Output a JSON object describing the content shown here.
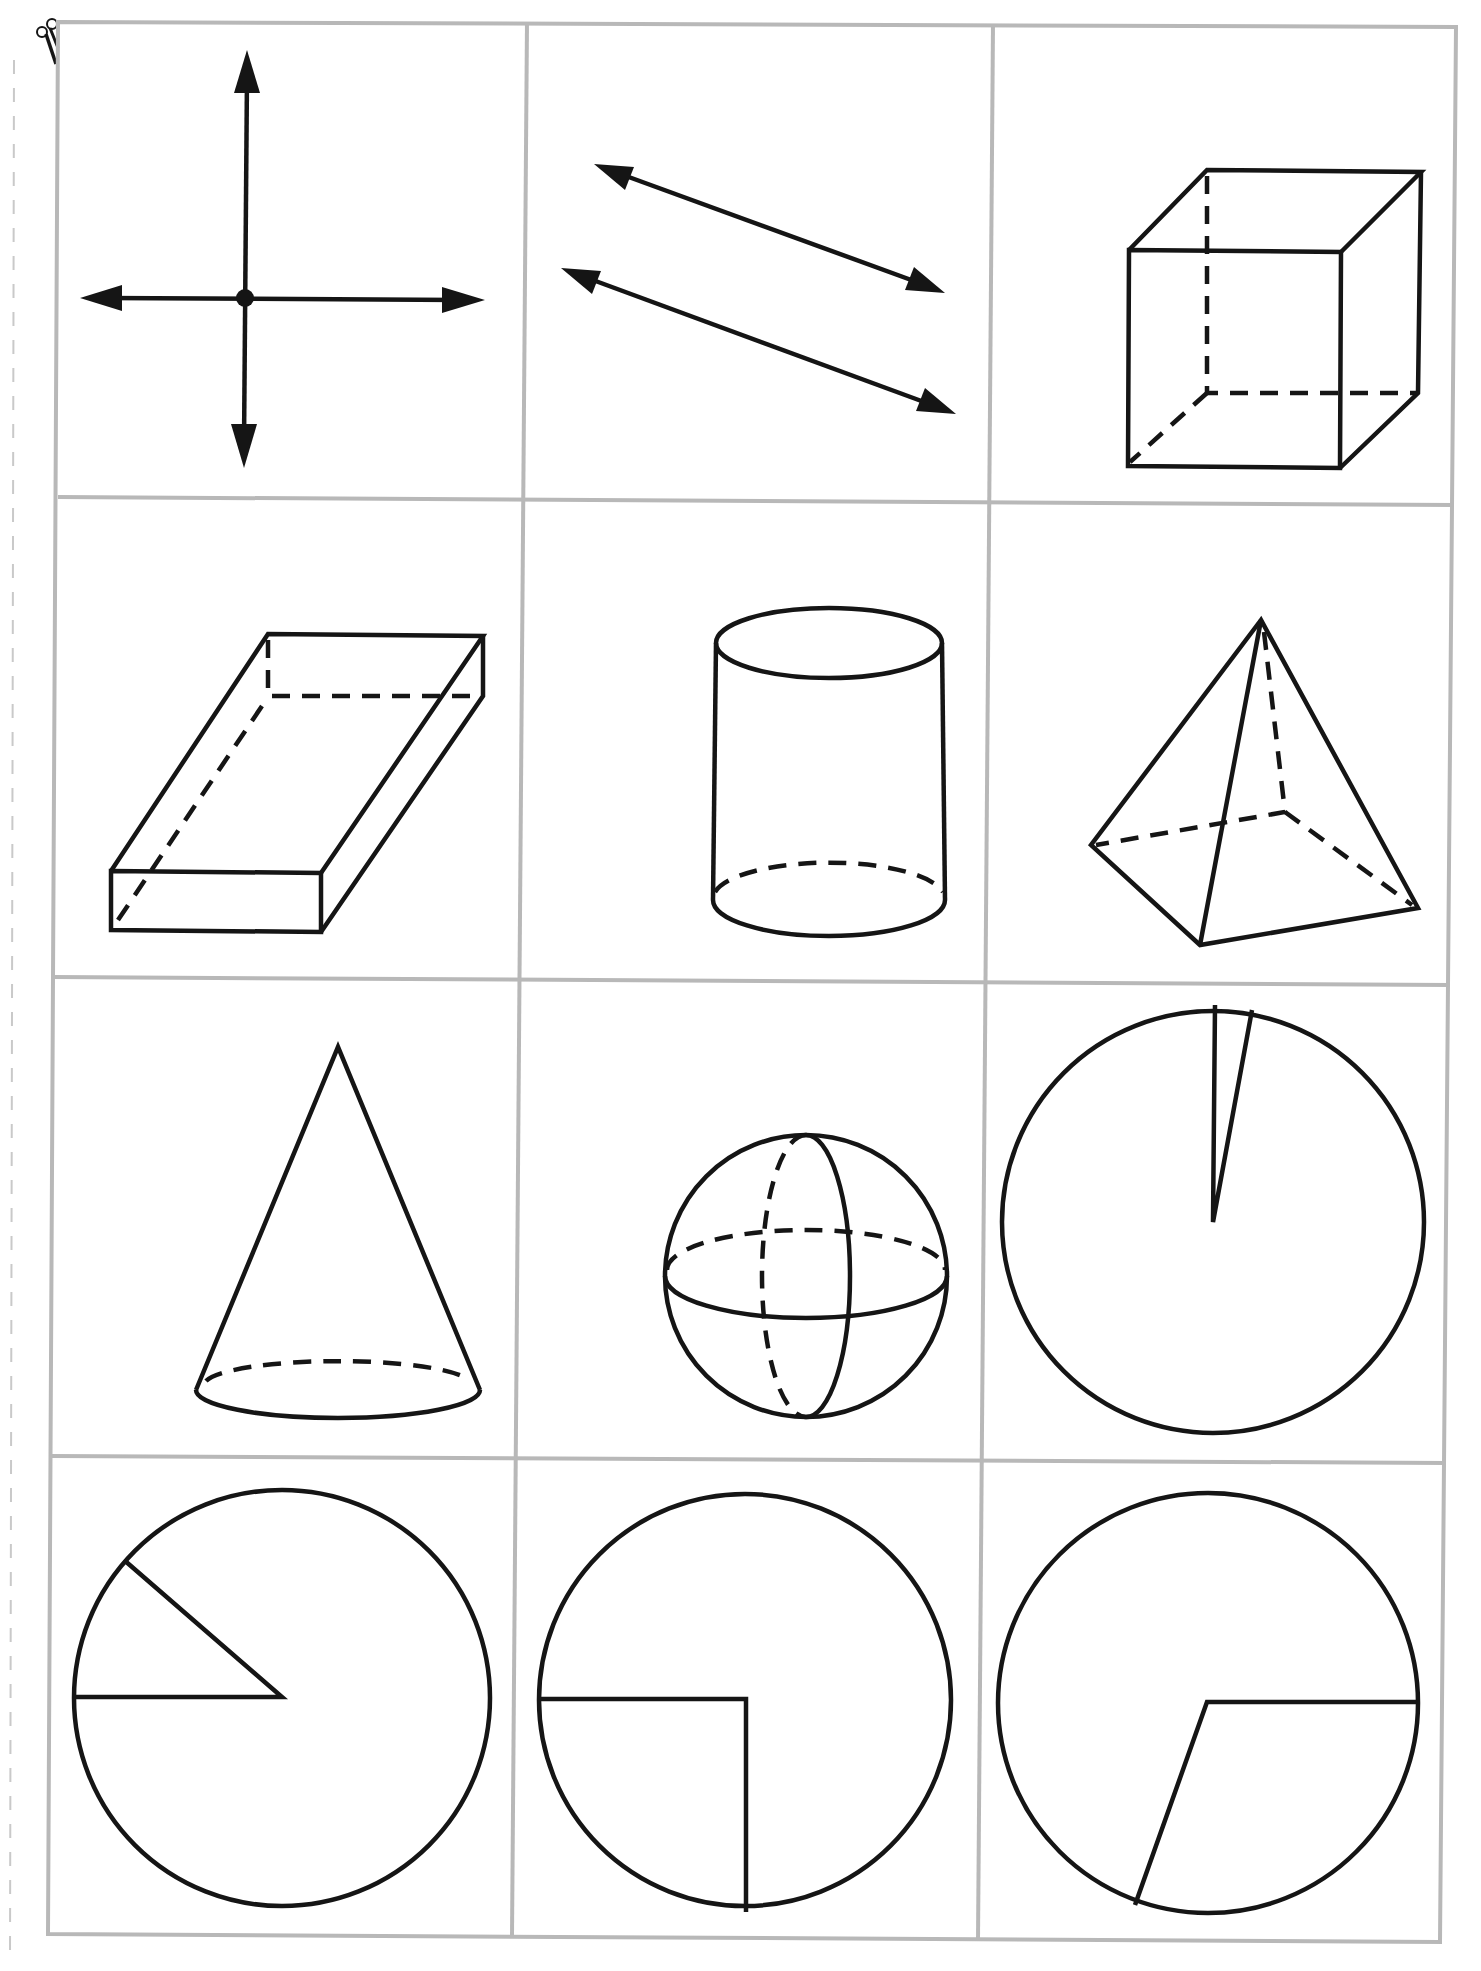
{
  "page": {
    "background": "#ffffff",
    "grid_color": "#b8b8b8",
    "line_color": "#151515",
    "rows": 4,
    "columns": 3
  },
  "icons": {
    "scissors": "scissors-icon"
  },
  "cards": [
    {
      "row": 1,
      "col": 1,
      "shape": "perpendicular-lines",
      "description": "Two perpendicular lines with arrows meeting at a point"
    },
    {
      "row": 1,
      "col": 2,
      "shape": "parallel-lines",
      "description": "Two parallel lines with arrows"
    },
    {
      "row": 1,
      "col": 3,
      "shape": "cube",
      "description": "Cube with hidden edges dashed"
    },
    {
      "row": 2,
      "col": 1,
      "shape": "rectangular-prism",
      "description": "Flat rectangular prism with hidden edges dashed"
    },
    {
      "row": 2,
      "col": 2,
      "shape": "cylinder",
      "description": "Cylinder with hidden base edge dashed"
    },
    {
      "row": 2,
      "col": 3,
      "shape": "square-pyramid",
      "description": "Square pyramid with hidden edges dashed"
    },
    {
      "row": 3,
      "col": 1,
      "shape": "cone",
      "description": "Cone with hidden base edge dashed"
    },
    {
      "row": 3,
      "col": 2,
      "shape": "sphere",
      "description": "Sphere with dashed hidden great circles"
    },
    {
      "row": 3,
      "col": 3,
      "shape": "circle-with-acute-angle",
      "description": "Circle with a very small acute central angle"
    },
    {
      "row": 4,
      "col": 1,
      "shape": "circle-with-acute-angle",
      "description": "Circle with a central angle of about 35 degrees"
    },
    {
      "row": 4,
      "col": 2,
      "shape": "circle-with-right-angle",
      "description": "Circle with a 90 degree central angle"
    },
    {
      "row": 4,
      "col": 3,
      "shape": "circle-with-obtuse-angle",
      "description": "Circle with an obtuse central angle of about 110 degrees"
    }
  ]
}
